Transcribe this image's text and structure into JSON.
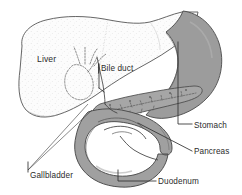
{
  "figure": {
    "background_color": "#ffffff",
    "width": 242,
    "height": 195
  },
  "palette": {
    "liver_fill": "#fbfbfb",
    "liver_stipple": "#cfcfcf",
    "stomach_fill": "#9c9c9c",
    "duodenum_fill": "#a0a0a0",
    "pancreas_fill": "#aaaaaa",
    "gallbladder_fill": "#f2f2f2",
    "outline": "#4a4a4a",
    "text": "#2b2b2b"
  },
  "labels": [
    {
      "id": "liver",
      "text": "Liver",
      "x": 37,
      "y": 62,
      "anchor": "start",
      "has_leader": false,
      "boxed": false
    },
    {
      "id": "bile-duct",
      "text": "Bile duct",
      "x": 101,
      "y": 71,
      "anchor": "start",
      "has_leader": true,
      "boxed": true
    },
    {
      "id": "gallbladder",
      "text": "Gallbladder",
      "x": 30,
      "y": 178,
      "anchor": "start",
      "has_leader": true,
      "boxed": false
    },
    {
      "id": "stomach",
      "text": "Stomach",
      "x": 194,
      "y": 128,
      "anchor": "start",
      "has_leader": true,
      "boxed": false
    },
    {
      "id": "pancreas",
      "text": "Pancreas",
      "x": 194,
      "y": 154,
      "anchor": "start",
      "has_leader": true,
      "boxed": false
    },
    {
      "id": "duodenum",
      "text": "Duodenum",
      "x": 158,
      "y": 184,
      "anchor": "start",
      "has_leader": true,
      "boxed": false
    }
  ],
  "organs": [
    {
      "id": "liver",
      "name": "Liver",
      "shading": "stippled-light"
    },
    {
      "id": "stomach",
      "name": "Stomach",
      "shading": "solid-gray"
    },
    {
      "id": "duodenum",
      "name": "Duodenum",
      "shading": "solid-gray"
    },
    {
      "id": "pancreas",
      "name": "Pancreas",
      "shading": "solid-gray-duct"
    },
    {
      "id": "gallbladder",
      "name": "Gallbladder",
      "shading": "dashed-hidden"
    },
    {
      "id": "bile-duct",
      "name": "Bile duct",
      "shading": "line"
    }
  ]
}
